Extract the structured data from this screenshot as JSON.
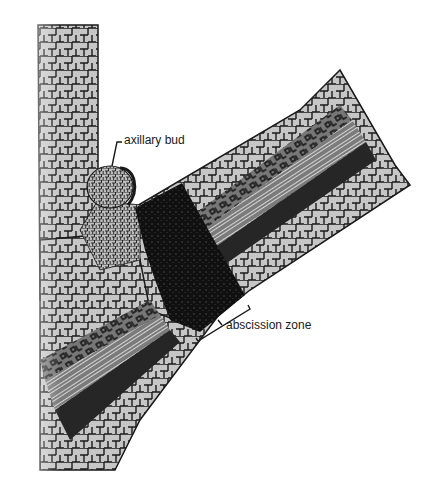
{
  "figure": {
    "labels": {
      "axillary_bud": "axillary bud",
      "abscission_zone": "abscission zone"
    },
    "signature": "JPM"
  },
  "colors": {
    "background": "#ffffff",
    "cell_fill": "#c4c4c4",
    "cell_wall": "#1a1a1a",
    "abscission_zone_fill": "#0d0d0d",
    "vascular_strand": "#2a2a2a"
  }
}
